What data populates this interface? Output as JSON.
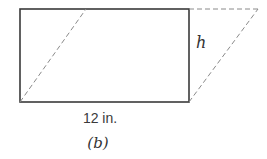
{
  "figure": {
    "label": "(b)",
    "height_label": "h",
    "base_label": "12 in."
  },
  "shapes": {
    "rectangle": {
      "x1": 20,
      "y1": 9,
      "x2": 189,
      "y2": 102,
      "style": "solid"
    },
    "parallelogram": {
      "points": [
        [
          20,
          102
        ],
        [
          86,
          9
        ],
        [
          258,
          9
        ],
        [
          189,
          102
        ]
      ],
      "style": "dashed"
    }
  },
  "colors": {
    "solid_line": "#3a3a3a",
    "dashed_line": "#8a8a8a",
    "text": "#333333",
    "background": "#ffffff"
  }
}
